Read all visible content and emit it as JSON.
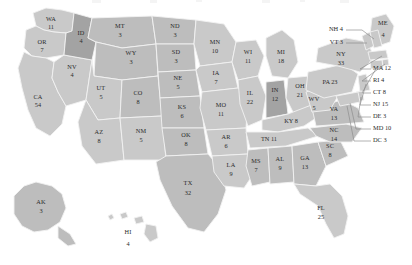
{
  "map": {
    "title": "United States Electoral College Map",
    "colors": {
      "background": "#ffffff",
      "state_fill_light": "#c9c9c9",
      "state_fill_mid": "#bdbdbd",
      "state_fill_dark": "#a3a3a3",
      "border": "#f2f2f2",
      "callout_line": "#8a8a8a",
      "text": "#2b2b2b"
    },
    "states": [
      {
        "code": "WA",
        "votes": "11",
        "tone": "light"
      },
      {
        "code": "OR",
        "votes": "7",
        "tone": "light"
      },
      {
        "code": "CA",
        "votes": "54",
        "tone": "light"
      },
      {
        "code": "NV",
        "votes": "4",
        "tone": "light"
      },
      {
        "code": "ID",
        "votes": "4",
        "tone": "dark"
      },
      {
        "code": "MT",
        "votes": "3",
        "tone": "mid"
      },
      {
        "code": "WY",
        "votes": "3",
        "tone": "mid"
      },
      {
        "code": "UT",
        "votes": "5",
        "tone": "light"
      },
      {
        "code": "AZ",
        "votes": "8",
        "tone": "light"
      },
      {
        "code": "CO",
        "votes": "8",
        "tone": "mid"
      },
      {
        "code": "NM",
        "votes": "5",
        "tone": "light"
      },
      {
        "code": "ND",
        "votes": "3",
        "tone": "mid"
      },
      {
        "code": "SD",
        "votes": "3",
        "tone": "mid"
      },
      {
        "code": "NE",
        "votes": "5",
        "tone": "mid"
      },
      {
        "code": "KS",
        "votes": "6",
        "tone": "mid"
      },
      {
        "code": "OK",
        "votes": "8",
        "tone": "mid"
      },
      {
        "code": "TX",
        "votes": "32",
        "tone": "mid"
      },
      {
        "code": "MN",
        "votes": "10",
        "tone": "light"
      },
      {
        "code": "IA",
        "votes": "7",
        "tone": "light"
      },
      {
        "code": "MO",
        "votes": "11",
        "tone": "light"
      },
      {
        "code": "AR",
        "votes": "6",
        "tone": "light"
      },
      {
        "code": "LA",
        "votes": "9",
        "tone": "light"
      },
      {
        "code": "WI",
        "votes": "11",
        "tone": "light"
      },
      {
        "code": "IL",
        "votes": "22",
        "tone": "light"
      },
      {
        "code": "MI",
        "votes": "18",
        "tone": "light"
      },
      {
        "code": "IN",
        "votes": "12",
        "tone": "dark"
      },
      {
        "code": "OH",
        "votes": "21",
        "tone": "light"
      },
      {
        "code": "KY",
        "votes": "8",
        "tone": "light"
      },
      {
        "code": "TN",
        "votes": "11",
        "tone": "light"
      },
      {
        "code": "MS",
        "votes": "7",
        "tone": "mid"
      },
      {
        "code": "AL",
        "votes": "9",
        "tone": "mid"
      },
      {
        "code": "GA",
        "votes": "13",
        "tone": "mid"
      },
      {
        "code": "FL",
        "votes": "25",
        "tone": "light"
      },
      {
        "code": "SC",
        "votes": "8",
        "tone": "mid"
      },
      {
        "code": "NC",
        "votes": "14",
        "tone": "mid"
      },
      {
        "code": "VA",
        "votes": "13",
        "tone": "mid"
      },
      {
        "code": "WV",
        "votes": "5",
        "tone": "light"
      },
      {
        "code": "PA",
        "votes": "23",
        "tone": "light"
      },
      {
        "code": "NY",
        "votes": "33",
        "tone": "light"
      },
      {
        "code": "ME",
        "votes": "4",
        "tone": "light"
      },
      {
        "code": "AK",
        "votes": "3",
        "tone": "mid"
      },
      {
        "code": "HI",
        "votes": "4",
        "tone": "light"
      }
    ],
    "callouts_left": [
      {
        "code": "NH",
        "votes": "4",
        "label": "NH 4"
      },
      {
        "code": "VT",
        "votes": "3",
        "label": "VT 3"
      }
    ],
    "callouts_right": [
      {
        "code": "MA",
        "votes": "12",
        "label": "MA 12"
      },
      {
        "code": "RI",
        "votes": "4",
        "label": "RI 4"
      },
      {
        "code": "CT",
        "votes": "8",
        "label": "CT 8"
      },
      {
        "code": "NJ",
        "votes": "15",
        "label": "NJ 15"
      },
      {
        "code": "DE",
        "votes": "3",
        "label": "DE 3"
      },
      {
        "code": "MD",
        "votes": "10",
        "label": "MD 10"
      },
      {
        "code": "DC",
        "votes": "3",
        "label": "DC 3"
      }
    ],
    "inline_labels": [
      {
        "code": "PA",
        "label": "PA 23"
      },
      {
        "code": "KY",
        "label": "KY 8"
      },
      {
        "code": "TN",
        "label": "TN 11"
      }
    ]
  }
}
